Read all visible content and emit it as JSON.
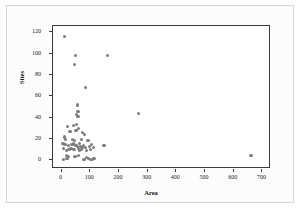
{
  "chart_data": {
    "type": "scatter",
    "title": "",
    "xlabel": "Area",
    "ylabel": "Sites",
    "xlim": [
      -30,
      730
    ],
    "ylim": [
      -8,
      126
    ],
    "xticks": [
      0,
      100,
      200,
      300,
      400,
      500,
      600,
      700
    ],
    "yticks": [
      0,
      20,
      40,
      60,
      80,
      100,
      120
    ],
    "grid": false,
    "legend": null,
    "marker_color": "#7d7d7d",
    "frame_color": "#3a3a3a",
    "points": [
      {
        "x": 10,
        "y": 116
      },
      {
        "x": 48,
        "y": 98
      },
      {
        "x": 160,
        "y": 98
      },
      {
        "x": 45,
        "y": 90
      },
      {
        "x": 82,
        "y": 68
      },
      {
        "x": 56,
        "y": 52
      },
      {
        "x": 57,
        "y": 46
      },
      {
        "x": 53,
        "y": 43
      },
      {
        "x": 268,
        "y": 44
      },
      {
        "x": 57,
        "y": 41
      },
      {
        "x": 21,
        "y": 32
      },
      {
        "x": 42,
        "y": 33
      },
      {
        "x": 52,
        "y": 34
      },
      {
        "x": 60,
        "y": 30
      },
      {
        "x": 29,
        "y": 27
      },
      {
        "x": 50,
        "y": 28
      },
      {
        "x": 73,
        "y": 26
      },
      {
        "x": 80,
        "y": 24
      },
      {
        "x": 9,
        "y": 22
      },
      {
        "x": 14,
        "y": 20
      },
      {
        "x": 39,
        "y": 20
      },
      {
        "x": 44,
        "y": 19
      },
      {
        "x": 70,
        "y": 20
      },
      {
        "x": 92,
        "y": 19
      },
      {
        "x": 5,
        "y": 16
      },
      {
        "x": 12,
        "y": 15
      },
      {
        "x": 23,
        "y": 14
      },
      {
        "x": 36,
        "y": 15
      },
      {
        "x": 41,
        "y": 16
      },
      {
        "x": 46,
        "y": 15
      },
      {
        "x": 48,
        "y": 14
      },
      {
        "x": 52,
        "y": 14
      },
      {
        "x": 55,
        "y": 13
      },
      {
        "x": 62,
        "y": 16
      },
      {
        "x": 66,
        "y": 13
      },
      {
        "x": 71,
        "y": 12
      },
      {
        "x": 76,
        "y": 14
      },
      {
        "x": 84,
        "y": 12
      },
      {
        "x": 97,
        "y": 13
      },
      {
        "x": 104,
        "y": 15
      },
      {
        "x": 110,
        "y": 12
      },
      {
        "x": 148,
        "y": 14
      },
      {
        "x": 7,
        "y": 11
      },
      {
        "x": 17,
        "y": 9
      },
      {
        "x": 26,
        "y": 10
      },
      {
        "x": 33,
        "y": 11
      },
      {
        "x": 43,
        "y": 10
      },
      {
        "x": 58,
        "y": 11
      },
      {
        "x": 63,
        "y": 9
      },
      {
        "x": 68,
        "y": 10
      },
      {
        "x": 88,
        "y": 9
      },
      {
        "x": 101,
        "y": 10
      },
      {
        "x": 16,
        "y": 5
      },
      {
        "x": 24,
        "y": 4
      },
      {
        "x": 47,
        "y": 4
      },
      {
        "x": 59,
        "y": 5
      },
      {
        "x": 86,
        "y": 3
      },
      {
        "x": 95,
        "y": 2
      },
      {
        "x": 660,
        "y": 5
      },
      {
        "x": 6,
        "y": 1
      },
      {
        "x": 19,
        "y": 2
      },
      {
        "x": 75,
        "y": 1
      },
      {
        "x": 80,
        "y": 1
      },
      {
        "x": 100,
        "y": 1
      },
      {
        "x": 108,
        "y": 1
      },
      {
        "x": 113,
        "y": 2
      }
    ]
  }
}
